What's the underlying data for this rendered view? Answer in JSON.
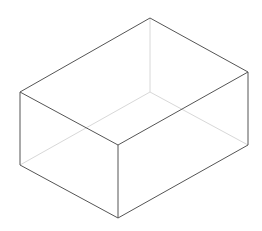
{
  "diagram": {
    "type": "wireframe-box",
    "colors": {
      "background": "#ffffff",
      "visible_edge": "#555555",
      "hidden_edge": "#d8d8d8"
    },
    "vertices": {
      "top_back": [
        150,
        18
      ],
      "top_left": [
        20,
        92
      ],
      "top_right": [
        248,
        72
      ],
      "top_front": [
        118,
        145
      ],
      "bottom_left": [
        20,
        165
      ],
      "bottom_right": [
        248,
        145
      ],
      "bottom_front": [
        118,
        218
      ],
      "bottom_back": [
        150,
        92
      ]
    }
  }
}
